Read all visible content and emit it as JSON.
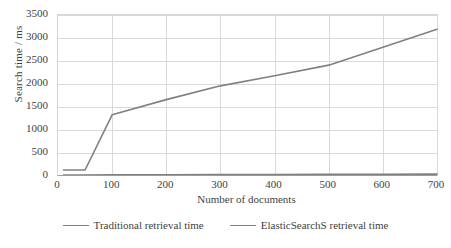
{
  "chart_data": {
    "type": "line",
    "title": "",
    "xlabel": "Number of documents",
    "ylabel": "Search time / ms",
    "xlim": [
      0,
      700
    ],
    "ylim": [
      0,
      3500
    ],
    "xticks": [
      0,
      100,
      200,
      300,
      400,
      500,
      600,
      700
    ],
    "yticks": [
      0,
      500,
      1000,
      1500,
      2000,
      2500,
      3000,
      3500
    ],
    "xtick_labels": [
      "0",
      "100",
      "200",
      "300",
      "400",
      "500",
      "600",
      "700"
    ],
    "ytick_labels": [
      "0",
      "500",
      "1000",
      "1500",
      "2000",
      "2500",
      "3000",
      "3500"
    ],
    "grid": "horizontal-and-vertical",
    "legend_position": "bottom",
    "series": [
      {
        "name": "Traditional retrieval time",
        "color": "#808080",
        "x": [
          10,
          50,
          100,
          200,
          300,
          400,
          500,
          600,
          700
        ],
        "values": [
          130,
          130,
          1330,
          1660,
          1960,
          2180,
          2410,
          2800,
          3190
        ]
      },
      {
        "name": "ElasticSearchS retrieval time",
        "color": "#808080",
        "x": [
          10,
          50,
          100,
          200,
          300,
          400,
          500,
          600,
          700
        ],
        "values": [
          20,
          22,
          25,
          28,
          30,
          32,
          35,
          38,
          40
        ]
      }
    ]
  },
  "legend": {
    "items": [
      {
        "label": "Traditional retrieval time",
        "color": "#808080"
      },
      {
        "label": "ElasticSearchS retrieval time",
        "color": "#808080"
      }
    ]
  },
  "axes": {
    "y_title": "Search time / ms",
    "x_title": "Number of documents"
  },
  "colors": {
    "line": "#808080",
    "grid": "#d9d9d9",
    "axis": "#d4d4d4",
    "text": "#3f3f3f",
    "background": "#ffffff"
  }
}
